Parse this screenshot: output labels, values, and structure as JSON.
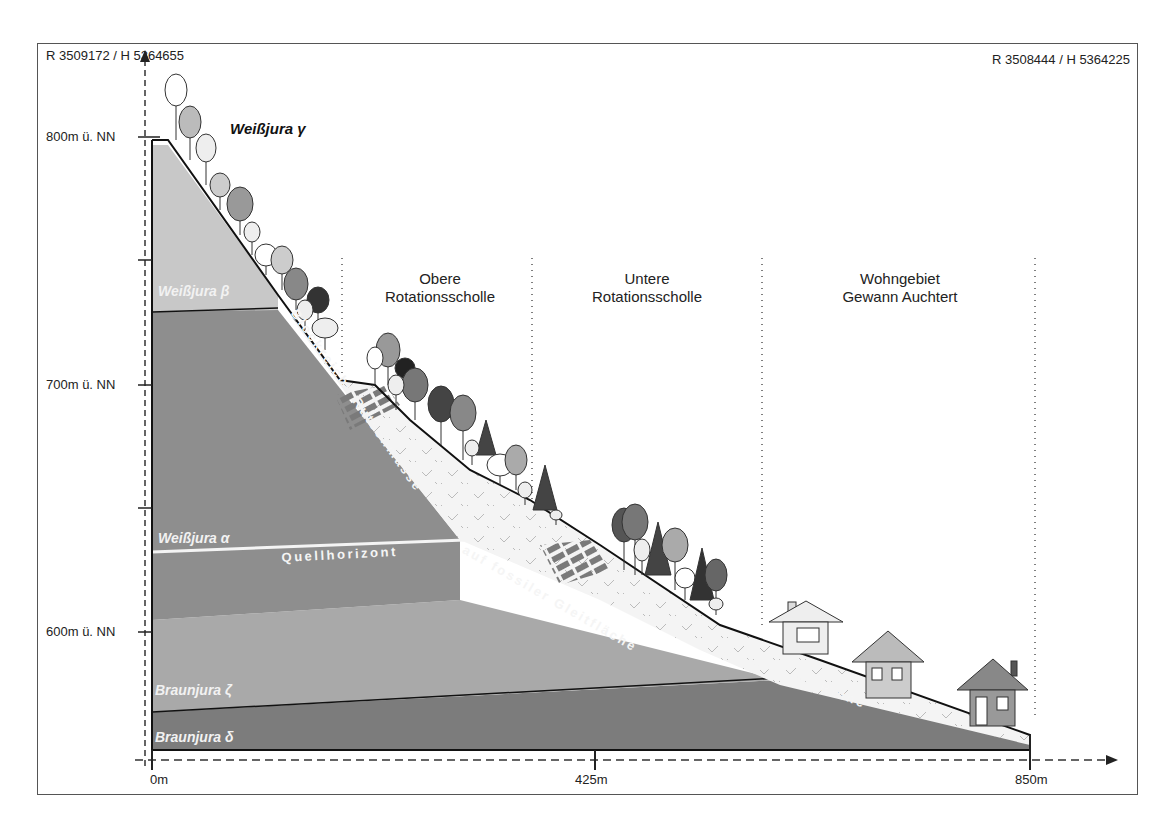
{
  "coordinates": {
    "left": "R 3509172 / H 5364655",
    "right": "R 3508444 / H 5364225"
  },
  "y_axis": {
    "ticks": [
      {
        "label": "800m ü. NN",
        "value": 800
      },
      {
        "label": "700m ü. NN",
        "value": 700
      },
      {
        "label": "600m ü. NN",
        "value": 600
      }
    ]
  },
  "x_axis": {
    "ticks": [
      {
        "label": "0m",
        "value": 0
      },
      {
        "label": "425m",
        "value": 425
      },
      {
        "label": "850m",
        "value": 850
      }
    ]
  },
  "zones": [
    {
      "line1": "Obere",
      "line2": "Rotationsscholle"
    },
    {
      "line1": "Untere",
      "line2": "Rotationsscholle"
    },
    {
      "line1": "Wohngebiet",
      "line2": "Gewann Auchtert"
    }
  ],
  "layers": {
    "weissjura_gamma": "Weißjura γ",
    "weissjura_beta": "Weißjura β",
    "weissjura_alpha": "Weißjura α",
    "braunjura_zeta": "Braunjura ζ",
    "braunjura_delta": "Braunjura δ"
  },
  "annotations": {
    "slide_mass": "Blockreiche Rutschmasse",
    "glide_surface": "auf fossiler Gleitfläche",
    "spring_horizon": "Quellhorizont",
    "channel": "Rinne"
  },
  "colors": {
    "weissjura_beta": "#c8c8c8",
    "weissjura_alpha": "#8e8e8e",
    "braunjura_zeta": "#a9a9a9",
    "braunjura_delta": "#7c7c7c",
    "slide_mass": "#f4f4f4"
  }
}
